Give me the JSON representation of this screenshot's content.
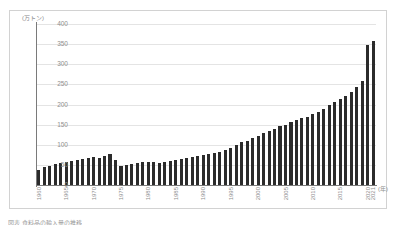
{
  "figure": {
    "unit_label": "(万トン)",
    "x_axis_unit": "(年)",
    "caption": "図表 食料品の輸入量の推移"
  },
  "chart_data": {
    "type": "bar",
    "title": "",
    "subtitle": "",
    "xlabel": "(年)",
    "ylabel": "(万トン)",
    "ylim": [
      0,
      400
    ],
    "ytick_values": [
      0,
      50,
      100,
      150,
      200,
      250,
      300,
      350,
      400
    ],
    "ytick_labels": [
      "0",
      "50",
      "100",
      "150",
      "200",
      "250",
      "300",
      "350",
      "400"
    ],
    "grid": true,
    "legend": "none",
    "bar_color": "#2b2b2b",
    "xtick_labels": [
      "1960",
      "1965",
      "1970",
      "1975",
      "1980",
      "1985",
      "1990",
      "1995",
      "2000",
      "2005",
      "2010",
      "2015",
      "2020",
      "2021"
    ],
    "categories": [
      "1960",
      "1961",
      "1962",
      "1963",
      "1964",
      "1965",
      "1966",
      "1967",
      "1968",
      "1969",
      "1970",
      "1971",
      "1972",
      "1973",
      "1974",
      "1975",
      "1976",
      "1977",
      "1978",
      "1979",
      "1980",
      "1981",
      "1982",
      "1983",
      "1984",
      "1985",
      "1986",
      "1987",
      "1988",
      "1989",
      "1990",
      "1991",
      "1992",
      "1993",
      "1994",
      "1995",
      "1996",
      "1997",
      "1998",
      "1999",
      "2000",
      "2001",
      "2002",
      "2003",
      "2004",
      "2005",
      "2006",
      "2007",
      "2008",
      "2009",
      "2010",
      "2011",
      "2012",
      "2013",
      "2014",
      "2015",
      "2016",
      "2017",
      "2018",
      "2019",
      "2020",
      "2021"
    ],
    "values": [
      38,
      45,
      48,
      52,
      55,
      58,
      60,
      63,
      65,
      68,
      70,
      66,
      72,
      78,
      62,
      48,
      50,
      52,
      54,
      56,
      58,
      56,
      55,
      57,
      60,
      62,
      65,
      68,
      70,
      72,
      75,
      78,
      80,
      82,
      86,
      92,
      100,
      106,
      110,
      116,
      122,
      128,
      134,
      140,
      146,
      150,
      156,
      162,
      166,
      170,
      176,
      182,
      190,
      198,
      206,
      214,
      222,
      232,
      244,
      258,
      348,
      358
    ]
  }
}
